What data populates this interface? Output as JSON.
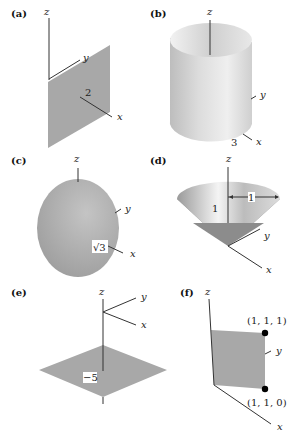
{
  "figure": {
    "panels": [
      {
        "id": "a",
        "label": "(a)",
        "axes": {
          "x": "x",
          "y": "y",
          "z": "z"
        },
        "annotation": "2",
        "surface": "plane"
      },
      {
        "id": "b",
        "label": "(b)",
        "axes": {
          "x": "x",
          "y": "y",
          "z": "z"
        },
        "annotation": "3",
        "surface": "cylinder"
      },
      {
        "id": "c",
        "label": "(c)",
        "axes": {
          "x": "x",
          "y": "y",
          "z": "z"
        },
        "annotation": "√3",
        "surface": "sphere"
      },
      {
        "id": "d",
        "label": "(d)",
        "axes": {
          "x": "x",
          "y": "y",
          "z": "z"
        },
        "annotation_height": "1",
        "annotation_radius": "1",
        "surface": "cone"
      },
      {
        "id": "e",
        "label": "(e)",
        "axes": {
          "x": "x",
          "y": "y",
          "z": "z"
        },
        "annotation": "−5",
        "surface": "horizontal-plane"
      },
      {
        "id": "f",
        "label": "(f)",
        "axes": {
          "x": "x",
          "y": "y",
          "z": "z"
        },
        "point_top": "(1, 1, 1)",
        "point_bottom": "(1, 1, 0)",
        "surface": "square"
      }
    ]
  },
  "colors": {
    "surface": "#a8a8a8",
    "surface_light": "#e6e6e6",
    "surface_dark": "#8c8c8c",
    "axis": "#333333",
    "background": "#ffffff"
  }
}
